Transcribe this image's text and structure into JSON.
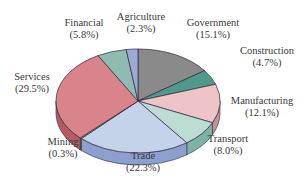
{
  "chart_data": {
    "type": "pie",
    "style": "3d-tilted",
    "title": "",
    "start": "top",
    "direction": "clockwise",
    "slices": [
      {
        "label": "Government",
        "value": 15.1,
        "value_label": "(15.1%)",
        "color": "#8a8a8a",
        "side_color": "#6d6d6d"
      },
      {
        "label": "Construction",
        "value": 4.7,
        "value_label": "(4.7%)",
        "color": "#4f9a8c",
        "side_color": "#3d7d71"
      },
      {
        "label": "Manufacturing",
        "value": 12.1,
        "value_label": "(12.1%)",
        "color": "#eec4c8",
        "side_color": "#c98f96"
      },
      {
        "label": "Transport",
        "value": 8.0,
        "value_label": "(8.0%)",
        "color": "#bcdcd4",
        "side_color": "#7fb2a6"
      },
      {
        "label": "Trade",
        "value": 22.3,
        "value_label": "(22.3%)",
        "color": "#c5d3ea",
        "side_color": "#8c9fcf"
      },
      {
        "label": "Mining",
        "value": 0.3,
        "value_label": "(0.3%)",
        "color": "#b0b0b0",
        "side_color": "#777777"
      },
      {
        "label": "Services",
        "value": 29.5,
        "value_label": "(29.5%)",
        "color": "#d8848a",
        "side_color": "#b55a62"
      },
      {
        "label": "Financial",
        "value": 5.8,
        "value_label": "(5.8%)",
        "color": "#8fbcb0",
        "side_color": "#6a998d"
      },
      {
        "label": "Agriculture",
        "value": 2.3,
        "value_label": "(2.3%)",
        "color": "#9fa9d6",
        "side_color": "#7a85b8"
      }
    ],
    "outline_color": "#2a2a3a"
  }
}
